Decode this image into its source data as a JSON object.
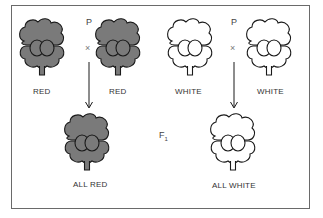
{
  "figure": {
    "type": "genetics-cross-diagram",
    "colors": {
      "red_fill": "#7a7a7a",
      "white_fill": "#ffffff",
      "outline": "#1a1a1a",
      "frame": "#6a6a6a"
    },
    "crosses": [
      {
        "generation_label_parent": "P",
        "cross_symbol": "×",
        "parents": [
          {
            "label": "RED",
            "color": "red"
          },
          {
            "label": "RED",
            "color": "red"
          }
        ],
        "offspring": {
          "label": "ALL RED",
          "color": "red"
        }
      },
      {
        "generation_label_parent": "P",
        "cross_symbol": "×",
        "parents": [
          {
            "label": "WHITE",
            "color": "white"
          },
          {
            "label": "WHITE",
            "color": "white"
          }
        ],
        "offspring": {
          "label": "ALL WHITE",
          "color": "white"
        }
      }
    ],
    "f1_label": "F",
    "f1_subscript": "1"
  }
}
